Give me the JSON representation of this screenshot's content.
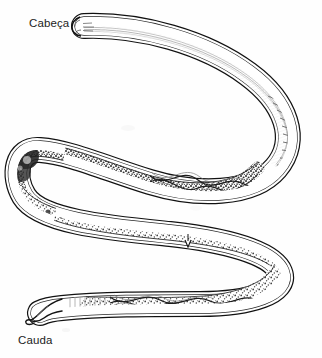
{
  "figure": {
    "background_color": "#fefefe",
    "ink_color": "#1a1a1a",
    "shading_color": "#6a6a6a",
    "labels": {
      "head": "Cabeça",
      "tail": "Cauda"
    },
    "label_positions": {
      "head": {
        "x": 29,
        "y": 17
      },
      "tail": {
        "x": 18,
        "y": 334
      }
    },
    "anatomy_parts": [
      {
        "name": "head-end",
        "label": "Cabeça",
        "description": "blunt rounded anterior tip with fine longitudinal striations"
      },
      {
        "name": "anterior-body",
        "description": "smooth tapering tube sweeping right and down"
      },
      {
        "name": "upper-loop",
        "description": "first bend of the S curve, dense granular gonad stippling"
      },
      {
        "name": "mid-body",
        "description": "straight midsection with intestinal granulation and vulva notch"
      },
      {
        "name": "vulva-marking",
        "description": "small ventral notch on mid-body"
      },
      {
        "name": "lower-loop",
        "description": "second bend of the S curve with coiled reproductive tract"
      },
      {
        "name": "posterior-body",
        "description": "braided intertwined uterine coils"
      },
      {
        "name": "tail-end",
        "label": "Cauda",
        "description": "slender tapering posterior tip with slight terminal hook"
      }
    ]
  }
}
